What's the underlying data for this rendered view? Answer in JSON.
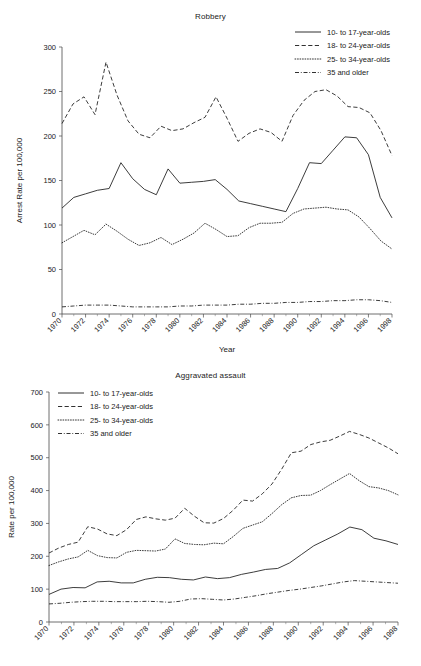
{
  "page": {
    "corner_mark": "",
    "background": "#ffffff",
    "line_color": "#1a1a1a"
  },
  "legend_entries": [
    {
      "label": "10- to 17-year-olds",
      "style": "solid"
    },
    {
      "label": "18- to 24-year-olds",
      "style": "dashed"
    },
    {
      "label": "25- to 34-year-olds",
      "style": "dotted"
    },
    {
      "label": "35 and older",
      "style": "dashdot"
    }
  ],
  "chart_data": [
    {
      "type": "line",
      "id": "robbery",
      "title": "Robbery",
      "xlabel": "Year",
      "ylabel": "Arrest Rate per 100,000",
      "ylim": [
        0,
        300
      ],
      "yticks": [
        0,
        50,
        100,
        150,
        200,
        250,
        300
      ],
      "xlim": [
        1970,
        1998
      ],
      "xticks": [
        1970,
        1972,
        1974,
        1976,
        1978,
        1980,
        1982,
        1984,
        1986,
        1988,
        1990,
        1992,
        1994,
        1996,
        1998
      ],
      "xticklabels": [
        "1970",
        "1972",
        "1974",
        "1976",
        "1978",
        "1980",
        "1982",
        "1984",
        "1986",
        "1988",
        "1990",
        "1992",
        "1994",
        "1996",
        "1998"
      ],
      "grid": false,
      "legend_position": "top-right-outside",
      "x": [
        1970,
        1971,
        1972,
        1973,
        1974,
        1975,
        1976,
        1977,
        1978,
        1979,
        1980,
        1981,
        1982,
        1983,
        1984,
        1985,
        1986,
        1987,
        1988,
        1989,
        1990,
        1991,
        1992,
        1993,
        1994,
        1995,
        1996,
        1997,
        1998
      ],
      "series": [
        {
          "name": "10- to 17-year-olds",
          "style": "solid",
          "values": [
            119,
            131,
            135,
            139,
            141,
            170,
            152,
            140,
            134,
            163,
            147,
            148,
            149,
            151,
            140,
            127,
            124,
            121,
            118,
            115,
            141,
            170,
            169,
            184,
            199,
            198,
            179,
            131,
            108
          ]
        },
        {
          "name": "18- to 24-year-olds",
          "style": "dashed",
          "values": [
            214,
            236,
            244,
            224,
            283,
            246,
            217,
            202,
            198,
            211,
            206,
            208,
            215,
            221,
            244,
            220,
            194,
            203,
            208,
            204,
            194,
            223,
            240,
            250,
            252,
            245,
            233,
            232,
            226,
            206,
            178
          ]
        },
        {
          "name": "25- to 34-year-olds",
          "style": "dotted",
          "values": [
            80,
            87,
            94,
            89,
            101,
            93,
            84,
            77,
            80,
            86,
            78,
            84,
            91,
            102,
            95,
            87,
            88,
            97,
            102,
            102,
            103,
            113,
            118,
            119,
            120,
            118,
            117,
            109,
            96,
            82,
            73
          ]
        },
        {
          "name": "35 and older",
          "style": "dashdot",
          "values": [
            8,
            9,
            10,
            10,
            10,
            9,
            8,
            8,
            8,
            8,
            9,
            9,
            10,
            10,
            10,
            11,
            11,
            12,
            12,
            13,
            13,
            14,
            14,
            15,
            15,
            16,
            16,
            15,
            13
          ]
        }
      ]
    },
    {
      "type": "line",
      "id": "aggravated-assault",
      "title": "Aggravated assault",
      "xlabel": "",
      "ylabel": "Rate per 100,000",
      "ylim": [
        0,
        700
      ],
      "yticks": [
        0,
        100,
        200,
        300,
        400,
        500,
        600,
        700
      ],
      "xlim": [
        1970,
        1998
      ],
      "xticks": [
        1970,
        1972,
        1974,
        1976,
        1978,
        1980,
        1982,
        1984,
        1986,
        1988,
        1990,
        1992,
        1994,
        1996,
        1998
      ],
      "xticklabels": [
        "1970",
        "1972",
        "1974",
        "1976",
        "1978",
        "1980",
        "1982",
        "1984",
        "1986",
        "1988",
        "1990",
        "1992",
        "1994",
        "1996",
        "1998"
      ],
      "grid": false,
      "legend_position": "top-left-inside",
      "x": [
        1970,
        1971,
        1972,
        1973,
        1974,
        1975,
        1976,
        1977,
        1978,
        1979,
        1980,
        1981,
        1982,
        1983,
        1984,
        1985,
        1986,
        1987,
        1988,
        1989,
        1990,
        1991,
        1992,
        1993,
        1994,
        1995,
        1996,
        1997,
        1998
      ],
      "series": [
        {
          "name": "10- to 17-year-olds",
          "style": "solid",
          "values": [
            84,
            100,
            105,
            104,
            122,
            124,
            119,
            119,
            130,
            136,
            135,
            130,
            128,
            137,
            132,
            135,
            145,
            152,
            160,
            163,
            180,
            206,
            232,
            250,
            268,
            289,
            281,
            255,
            247,
            236
          ]
        },
        {
          "name": "18- to 24-year-olds",
          "style": "dashed",
          "values": [
            210,
            225,
            236,
            243,
            290,
            283,
            268,
            263,
            281,
            312,
            320,
            314,
            310,
            316,
            346,
            322,
            302,
            301,
            315,
            340,
            371,
            368,
            390,
            420,
            465,
            515,
            520,
            540,
            548,
            553,
            566,
            580,
            571,
            560,
            545,
            530,
            512
          ]
        },
        {
          "name": "25- to 34-year-olds",
          "style": "dotted",
          "values": [
            172,
            183,
            192,
            198,
            218,
            202,
            196,
            195,
            212,
            218,
            217,
            216,
            222,
            253,
            239,
            236,
            235,
            240,
            238,
            260,
            285,
            295,
            305,
            330,
            357,
            378,
            385,
            386,
            400,
            418,
            435,
            452,
            430,
            412,
            408,
            400,
            387
          ]
        },
        {
          "name": "35 and older",
          "style": "dashdot",
          "values": [
            55,
            57,
            60,
            62,
            63,
            63,
            62,
            62,
            62,
            63,
            62,
            60,
            63,
            70,
            71,
            69,
            67,
            70,
            75,
            80,
            86,
            91,
            96,
            100,
            105,
            110,
            116,
            122,
            126,
            124,
            122,
            120,
            118
          ]
        }
      ]
    }
  ]
}
